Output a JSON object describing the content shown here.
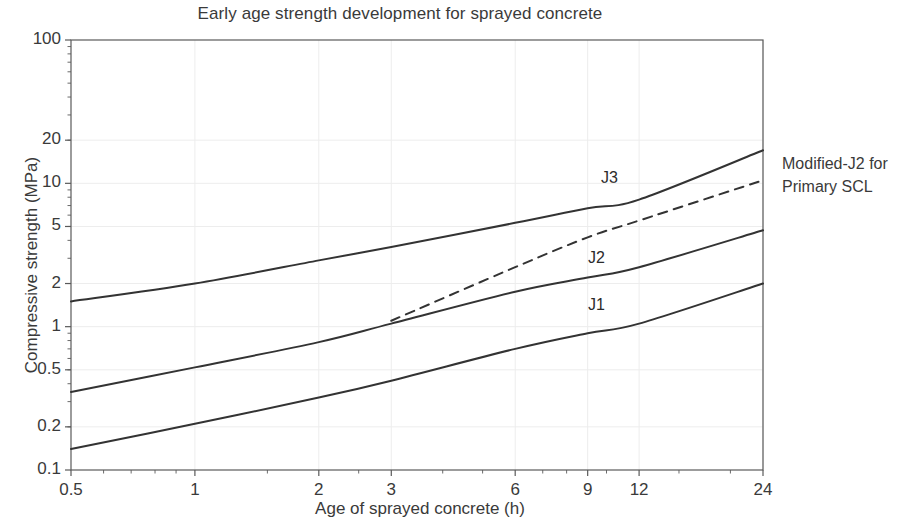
{
  "chart_data": {
    "type": "line",
    "title": "Early age strength development for sprayed concrete",
    "xlabel": "Age of sprayed concrete (h)",
    "ylabel": "Compressive strength (MPa)",
    "xscale": "log",
    "yscale": "log",
    "xlim": [
      0.5,
      24
    ],
    "ylim": [
      0.1,
      100
    ],
    "grid": true,
    "legend_position": "inline-labels",
    "x_tick_labels": [
      "0.5",
      "1",
      "2",
      "3",
      "6",
      "9",
      "12",
      "24"
    ],
    "x_tick_values": [
      0.5,
      1,
      2,
      3,
      6,
      9,
      12,
      24
    ],
    "y_tick_labels": [
      "100",
      "20",
      "10",
      "5",
      "2",
      "1",
      "0.5",
      "0.2",
      "0.1"
    ],
    "y_tick_values": [
      100,
      20,
      10,
      5,
      2,
      1,
      0.5,
      0.2,
      0.1
    ],
    "series": [
      {
        "name": "J3",
        "label": "J3",
        "style": "solid",
        "color": "#333333",
        "x": [
          0.5,
          1,
          2,
          3,
          6,
          9,
          12,
          24
        ],
        "y": [
          1.5,
          2.0,
          2.9,
          3.6,
          5.3,
          6.7,
          7.7,
          17.0
        ]
      },
      {
        "name": "Modified-J2",
        "label": "Modified-J2 for Primary SCL",
        "style": "dashed",
        "color": "#333333",
        "x": [
          3,
          6,
          9,
          12,
          24
        ],
        "y": [
          1.1,
          2.6,
          4.2,
          5.5,
          10.5
        ]
      },
      {
        "name": "J2",
        "label": "J2",
        "style": "solid",
        "color": "#333333",
        "x": [
          0.5,
          1,
          2,
          3,
          6,
          9,
          12,
          24
        ],
        "y": [
          0.35,
          0.52,
          0.78,
          1.05,
          1.75,
          2.2,
          2.6,
          4.7
        ]
      },
      {
        "name": "J1",
        "label": "J1",
        "style": "solid",
        "color": "#333333",
        "x": [
          0.5,
          1,
          2,
          3,
          6,
          9,
          12,
          24
        ],
        "y": [
          0.14,
          0.21,
          0.32,
          0.42,
          0.7,
          0.9,
          1.05,
          2.0
        ]
      }
    ],
    "annotations": [
      {
        "text": "J3",
        "x": 5.0,
        "y": 6.6
      },
      {
        "text": "J2",
        "x": 8.3,
        "y": 2.45
      },
      {
        "text": "J1",
        "x": 8.3,
        "y": 1.2
      },
      {
        "text": "Modified-J2 for Primary SCL",
        "x": 28,
        "y": 8.5
      }
    ]
  },
  "axes": {
    "title": "Early age strength development for sprayed concrete",
    "x_title": "Age of sprayed concrete (h)",
    "y_title": "Compressive strength (MPa)"
  },
  "side_note": {
    "line1": "Modified-J2 for",
    "line2": "Primary SCL"
  },
  "curve_labels": {
    "j3": "J3",
    "j2": "J2",
    "j1": "J1"
  },
  "y_ticks": [
    {
      "label": "100",
      "value": 100
    },
    {
      "label": "20",
      "value": 20
    },
    {
      "label": "10",
      "value": 10
    },
    {
      "label": "5",
      "value": 5
    },
    {
      "label": "2",
      "value": 2
    },
    {
      "label": "1",
      "value": 1
    },
    {
      "label": "0.5",
      "value": 0.5
    },
    {
      "label": "0.2",
      "value": 0.2
    },
    {
      "label": "0.1",
      "value": 0.1
    }
  ],
  "x_ticks": [
    {
      "label": "0.5",
      "value": 0.5
    },
    {
      "label": "1",
      "value": 1
    },
    {
      "label": "2",
      "value": 2
    },
    {
      "label": "3",
      "value": 3
    },
    {
      "label": "6",
      "value": 6
    },
    {
      "label": "9",
      "value": 9
    },
    {
      "label": "12",
      "value": 12
    },
    {
      "label": "24",
      "value": 24
    }
  ],
  "colors": {
    "axis": "#5a5a5a",
    "grid": "#ededed",
    "curve": "#333333",
    "text": "#3a3a3a"
  }
}
